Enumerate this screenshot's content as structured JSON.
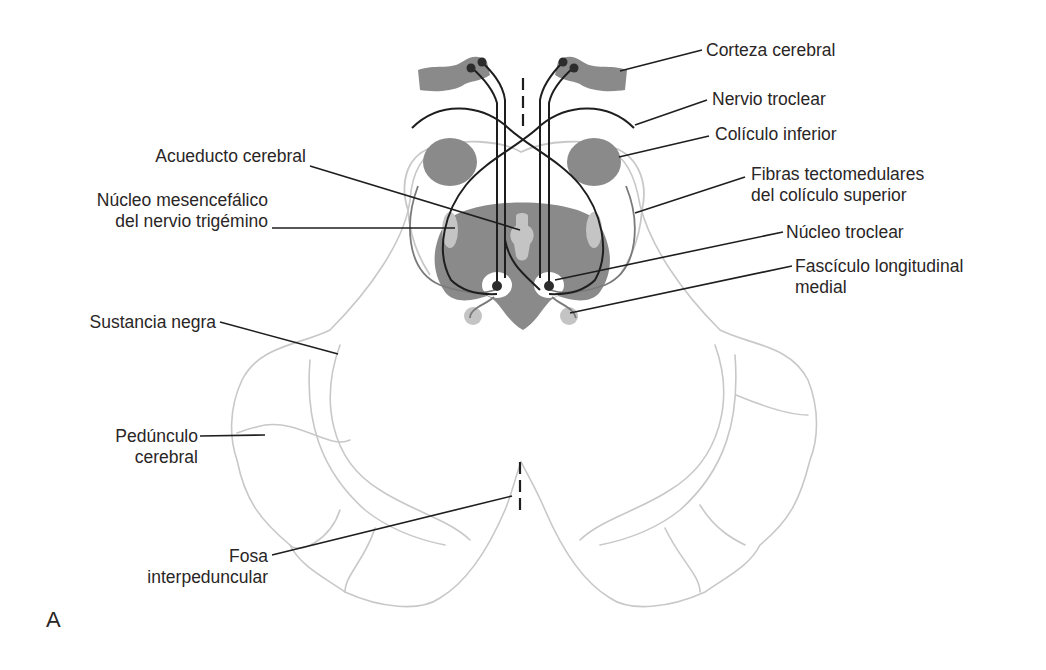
{
  "figure": {
    "panel_letter": "A"
  },
  "labels": {
    "corteza_cerebral": "Corteza cerebral",
    "nervio_troclear": "Nervio troclear",
    "coliculo_inferior": "Colículo inferior",
    "fibras_line1": "Fibras tectomedulares",
    "fibras_line2": "del colículo superior",
    "nucleo_troclear": "Núcleo troclear",
    "fasciculo_line1": "Fascículo longitudinal",
    "fasciculo_line2": "medial",
    "acueducto": "Acueducto cerebral",
    "mesencefalico_line1": "Núcleo mesencefálico",
    "mesencefalico_line2": "del nervio trigémino",
    "sustancia_negra": "Sustancia negra",
    "pedunculo_line1": "Pedúnculo",
    "pedunculo_line2": "cerebral",
    "fosa_line1": "Fosa",
    "fosa_line2": "interpeduncular"
  },
  "colors": {
    "outline": "#c8c8c8",
    "gray_fill": "#8a8a8a",
    "light_fill": "#c4c4c4",
    "fiber": "#1e1e1e",
    "leader": "#1e1e1e"
  }
}
